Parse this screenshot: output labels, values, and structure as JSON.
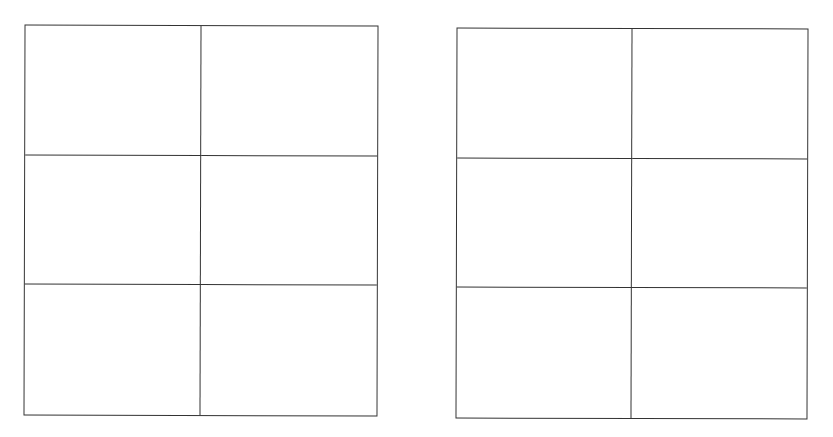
{
  "diagram": {
    "type": "empty-grid-tables",
    "line_color": "#333333",
    "background": "#ffffff",
    "grids": [
      {
        "name": "left-grid",
        "rows": 3,
        "columns": 2,
        "cells": [
          [
            "",
            ""
          ],
          [
            "",
            ""
          ],
          [
            "",
            ""
          ]
        ]
      },
      {
        "name": "right-grid",
        "rows": 3,
        "columns": 2,
        "cells": [
          [
            "",
            ""
          ],
          [
            "",
            ""
          ],
          [
            "",
            ""
          ]
        ]
      }
    ]
  }
}
